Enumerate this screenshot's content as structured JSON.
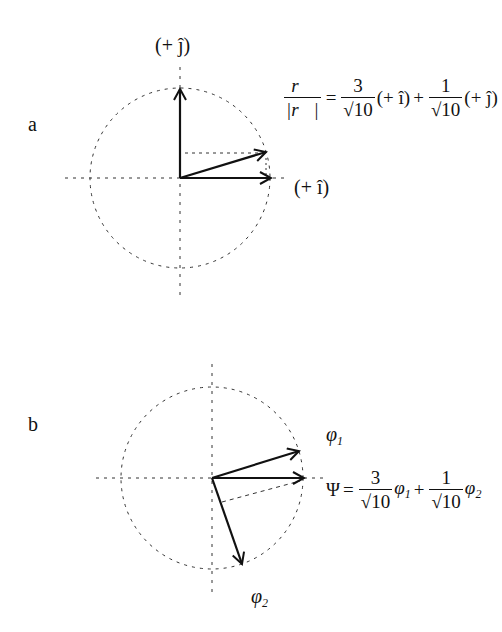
{
  "panels": {
    "a": {
      "label": "a",
      "axis_labels": {
        "x": "(+ î)",
        "y": "(+ ĵ)"
      },
      "equation": {
        "lhs_num": "r⃗",
        "lhs_den": "|r⃗|",
        "equals": "=",
        "term1_num": "3",
        "term1_den": "√10",
        "term1_basis": "(+ î)",
        "plus": "+",
        "term2_num": "1",
        "term2_den": "√10",
        "term2_basis": "(+ ĵ)"
      }
    },
    "b": {
      "label": "b",
      "vector_labels": {
        "phi1": "φ",
        "phi1_sub": "1",
        "phi2": "φ",
        "phi2_sub": "2"
      },
      "equation": {
        "lhs": "Ψ",
        "equals": "=",
        "term1_num": "3",
        "term1_den": "√10",
        "term1_basis": "φ",
        "term1_sub": "1",
        "plus": "+",
        "term2_num": "1",
        "term2_den": "√10",
        "term2_basis": "φ",
        "term2_sub": "2"
      }
    }
  },
  "colors": {
    "stroke": "#111111",
    "dashed": "#333333",
    "background": "#ffffff"
  }
}
